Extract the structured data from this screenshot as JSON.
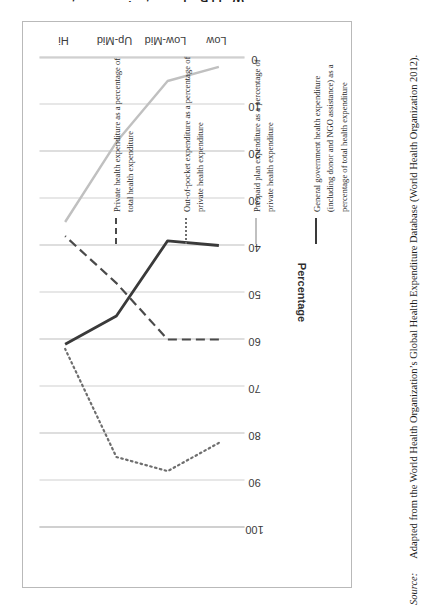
{
  "figure": {
    "source_label": "Source:",
    "source_text": "Adapted from the World Health Organization’s Global Health Expenditure Database (World Health Organization 2012)."
  },
  "legend": {
    "items": [
      {
        "style": "dashed",
        "color": "#4a4a4a",
        "label": "Private health expenditure as a percentage of total health expenditure"
      },
      {
        "style": "dotted",
        "color": "#6e6e6e",
        "label": "Out-of-pocket expenditure as a percentage of private health expenditure"
      },
      {
        "style": "solid-light",
        "color": "#c0c0c0",
        "label": "Pre-paid plan expenditure as a percentage of private health expenditure"
      },
      {
        "style": "solid-dark",
        "color": "#3a3a3a",
        "label": "General government health expenditure (including donor and NGO assistance) as a percentage of total health expenditure"
      }
    ]
  },
  "chart_data": {
    "type": "line",
    "title": "",
    "orientation": "rotated-90-ccw",
    "categories": [
      "Low",
      "Low-Mid",
      "Up-Mid",
      "Hi"
    ],
    "xlabel": "World Bank country income category",
    "ylabel": "Percentage",
    "ylim": [
      0,
      100
    ],
    "yticks": [
      100,
      90,
      80,
      70,
      60,
      50,
      40,
      30,
      20,
      10,
      0
    ],
    "ytick_order": "descending",
    "grid": true,
    "grid_axis": "y",
    "legend_position": "right",
    "series": [
      {
        "name": "Private health expenditure as a percentage of total health expenditure",
        "style": "dashed",
        "color": "#4a4a4a",
        "values": [
          60,
          60,
          48,
          38
        ]
      },
      {
        "name": "Out-of-pocket expenditure as a percentage of private health expenditure",
        "style": "dotted",
        "color": "#6e6e6e",
        "values": [
          82,
          88,
          85,
          62
        ]
      },
      {
        "name": "Pre-paid plan expenditure as a percentage of private health expenditure",
        "style": "solid-light",
        "color": "#c0c0c0",
        "values": [
          2,
          5,
          18,
          35
        ]
      },
      {
        "name": "General government health expenditure (including donor and NGO assistance) as a percentage of total health expenditure",
        "style": "solid-dark",
        "color": "#3a3a3a",
        "values": [
          40,
          39,
          55,
          61
        ]
      }
    ]
  }
}
